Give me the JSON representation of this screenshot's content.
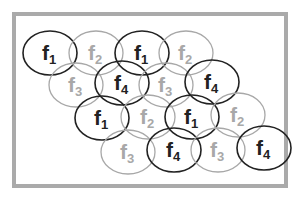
{
  "diagram": {
    "title": "",
    "frequency_reuse_cells": [
      {
        "label": "f",
        "sub": "1",
        "cx": 50,
        "cy": 53,
        "tone": "dark"
      },
      {
        "label": "f",
        "sub": "2",
        "cx": 96,
        "cy": 53,
        "tone": "light"
      },
      {
        "label": "f",
        "sub": "1",
        "cx": 142,
        "cy": 53,
        "tone": "dark"
      },
      {
        "label": "f",
        "sub": "2",
        "cx": 186,
        "cy": 53,
        "tone": "light"
      },
      {
        "label": "f",
        "sub": "3",
        "cx": 76,
        "cy": 85,
        "tone": "light"
      },
      {
        "label": "f",
        "sub": "4",
        "cx": 122,
        "cy": 83,
        "tone": "dark"
      },
      {
        "label": "f",
        "sub": "3",
        "cx": 166,
        "cy": 85,
        "tone": "light"
      },
      {
        "label": "f",
        "sub": "4",
        "cx": 212,
        "cy": 82,
        "tone": "dark"
      },
      {
        "label": "f",
        "sub": "1",
        "cx": 102,
        "cy": 118,
        "tone": "dark"
      },
      {
        "label": "f",
        "sub": "2",
        "cx": 148,
        "cy": 117,
        "tone": "light"
      },
      {
        "label": "f",
        "sub": "1",
        "cx": 192,
        "cy": 117,
        "tone": "dark"
      },
      {
        "label": "f",
        "sub": "2",
        "cx": 238,
        "cy": 115,
        "tone": "light"
      },
      {
        "label": "f",
        "sub": "3",
        "cx": 128,
        "cy": 152,
        "tone": "light"
      },
      {
        "label": "f",
        "sub": "4",
        "cx": 174,
        "cy": 150,
        "tone": "dark"
      },
      {
        "label": "f",
        "sub": "3",
        "cx": 218,
        "cy": 150,
        "tone": "light"
      },
      {
        "label": "f",
        "sub": "4",
        "cx": 264,
        "cy": 148,
        "tone": "dark"
      }
    ],
    "colors": {
      "dark": "#222222",
      "light": "#a8a8a8",
      "border": "#aaaaaa"
    }
  }
}
